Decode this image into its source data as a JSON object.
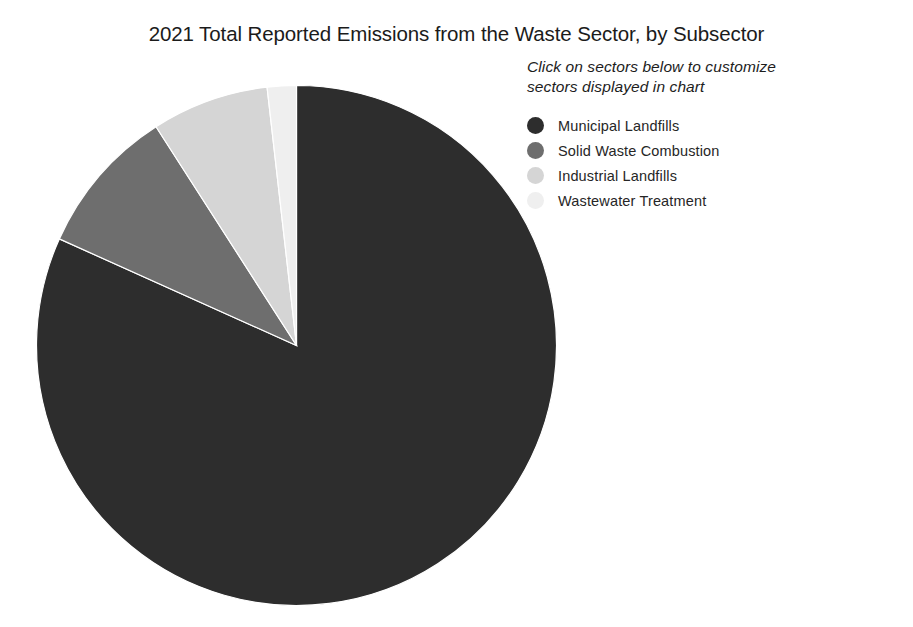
{
  "chart_data": {
    "type": "pie",
    "title": "2021 Total Reported Emissions from the Waste Sector, by Subsector",
    "subtitle": "Click on sectors below to customize sectors displayed in chart",
    "subtitle_lines": [
      "Click on sectors below to customize",
      "sectors displayed in chart"
    ],
    "categories": [
      "Municipal Landfills",
      "Solid Waste Combustion",
      "Industrial Landfills",
      "Wastewater Treatment"
    ],
    "values": [
      81.7,
      9.2,
      7.3,
      1.8
    ],
    "value_unit": "percent",
    "colors": [
      "#2d2d2d",
      "#6e6e6e",
      "#d5d5d5",
      "#efefef"
    ],
    "start_angle_deg": 0,
    "direction": "clockwise",
    "legend_position": "right",
    "grid": false,
    "xlabel": "",
    "ylabel": "",
    "slices": [
      {
        "label": "Municipal Landfills",
        "value": 81.7,
        "color": "#2d2d2d",
        "start_deg": 0.0,
        "end_deg": 294.2
      },
      {
        "label": "Solid Waste Combustion",
        "value": 9.2,
        "color": "#6e6e6e",
        "start_deg": 294.2,
        "end_deg": 327.3
      },
      {
        "label": "Industrial Landfills",
        "value": 7.3,
        "color": "#d5d5d5",
        "start_deg": 327.3,
        "end_deg": 353.5
      },
      {
        "label": "Wastewater Treatment",
        "value": 1.8,
        "color": "#efefef",
        "start_deg": 353.5,
        "end_deg": 360.0
      }
    ]
  },
  "legend": {
    "hint_line_1": "Click on sectors below to customize",
    "hint_line_2": "sectors displayed in chart",
    "items": [
      {
        "label": "Municipal Landfills",
        "color": "#2d2d2d"
      },
      {
        "label": "Solid Waste Combustion",
        "color": "#6e6e6e"
      },
      {
        "label": "Industrial Landfills",
        "color": "#d5d5d5"
      },
      {
        "label": "Wastewater Treatment",
        "color": "#efefef"
      }
    ]
  },
  "header": {
    "title": "2021 Total Reported Emissions from the Waste Sector, by Subsector"
  }
}
